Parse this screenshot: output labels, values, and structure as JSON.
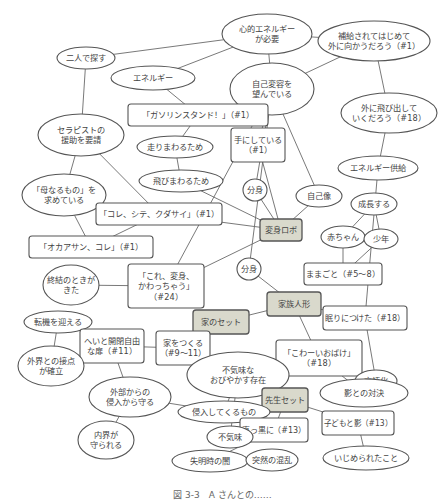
{
  "diagram": {
    "nodes": [
      {
        "id": "kokoro_energy",
        "shape": "ellipse",
        "label": [
          "心的エネルギー",
          "が必要"
        ]
      },
      {
        "id": "hokyu",
        "shape": "ellipse",
        "label": [
          "補給されてはじめて",
          "外に向かうだろう（#1）"
        ]
      },
      {
        "id": "futari",
        "shape": "ellipse",
        "label": [
          "二人で探す"
        ]
      },
      {
        "id": "energy",
        "shape": "ellipse",
        "label": [
          "エネルギー"
        ]
      },
      {
        "id": "jiko_henyo",
        "shape": "ellipse",
        "label": [
          "自己変容を",
          "望んでいる"
        ]
      },
      {
        "id": "gasoline",
        "shape": "box",
        "label": [
          "「ガソリンスタンド！」（#1）"
        ]
      },
      {
        "id": "soto_tobidashi",
        "shape": "ellipse",
        "label": [
          "外に飛び出して",
          "いくだろう（#18）"
        ]
      },
      {
        "id": "therapist",
        "shape": "ellipse",
        "label": [
          "セラピストの",
          "援助を要請"
        ]
      },
      {
        "id": "hashiri",
        "shape": "ellipse",
        "label": [
          "走りまわるため"
        ]
      },
      {
        "id": "te_ni",
        "shape": "box",
        "label": [
          "手にしている",
          "（#1）"
        ]
      },
      {
        "id": "energy_kyokyu",
        "shape": "ellipse",
        "label": [
          "エネルギー供給"
        ]
      },
      {
        "id": "tobi",
        "shape": "ellipse",
        "label": [
          "飛びまわるため"
        ]
      },
      {
        "id": "bunshin1",
        "shape": "ellipse",
        "label": [
          "分身"
        ]
      },
      {
        "id": "jikozo",
        "shape": "ellipse",
        "label": [
          "自己像"
        ]
      },
      {
        "id": "haha",
        "shape": "ellipse",
        "label": [
          "「母なるもの」を",
          "求めている"
        ]
      },
      {
        "id": "seicho",
        "shape": "ellipse",
        "label": [
          "成長する"
        ]
      },
      {
        "id": "kore_shite",
        "shape": "box",
        "label": [
          "「コレ、シテ、クダサイ」（#1）"
        ]
      },
      {
        "id": "henshin_robo",
        "shape": "box",
        "key": true,
        "label": [
          "変身ロボ"
        ]
      },
      {
        "id": "akachan",
        "shape": "ellipse",
        "label": [
          "赤ちゃん"
        ]
      },
      {
        "id": "shonen",
        "shape": "ellipse",
        "label": [
          "少年"
        ]
      },
      {
        "id": "okaasan",
        "shape": "box",
        "label": [
          "「オカアサン、コレ」（#1）"
        ]
      },
      {
        "id": "bunshin2",
        "shape": "ellipse",
        "label": [
          "分身"
        ]
      },
      {
        "id": "mamagoto",
        "shape": "box",
        "label": [
          "ままごと（#5～8）"
        ]
      },
      {
        "id": "shuketsu",
        "shape": "ellipse",
        "label": [
          "終結のときが",
          "きた"
        ]
      },
      {
        "id": "kore_henshin",
        "shape": "box",
        "label": [
          "「これ、変身、",
          "かわっちゃう」",
          "（#24）"
        ]
      },
      {
        "id": "kazoku",
        "shape": "box",
        "key": true,
        "label": [
          "家族人形"
        ]
      },
      {
        "id": "tenki",
        "shape": "ellipse",
        "label": [
          "転機を迎える"
        ]
      },
      {
        "id": "ie_set",
        "shape": "box",
        "key": true,
        "label": [
          "家のセット"
        ]
      },
      {
        "id": "nemuri",
        "shape": "box",
        "label": [
          "眠りにつけた（#18）"
        ]
      },
      {
        "id": "hei",
        "shape": "box",
        "label": [
          "へいと開閉自由",
          "な扉（#11）"
        ]
      },
      {
        "id": "ie_tsukuru",
        "shape": "box",
        "label": [
          "家をつくる",
          "（#9～11）"
        ]
      },
      {
        "id": "kowai",
        "shape": "box",
        "label": [
          "「こわーいおばけ」",
          "（#18）"
        ]
      },
      {
        "id": "gengo",
        "shape": "ellipse",
        "label": [
          "言語化"
        ]
      },
      {
        "id": "gaikai",
        "shape": "ellipse",
        "label": [
          "外界との接点",
          "が確立"
        ]
      },
      {
        "id": "bukimi_sonzai",
        "shape": "ellipse",
        "label": [
          "不気味な",
          "おびやかす存在"
        ]
      },
      {
        "id": "kage_taiketsu",
        "shape": "ellipse",
        "label": [
          "影との対決"
        ]
      },
      {
        "id": "gaibu",
        "shape": "ellipse",
        "label": [
          "外部からの",
          "侵入から守る"
        ]
      },
      {
        "id": "sensei",
        "shape": "box",
        "key": true,
        "label": [
          "先生セット"
        ]
      },
      {
        "id": "shinnyu",
        "shape": "ellipse",
        "label": [
          "侵入してくるもの"
        ]
      },
      {
        "id": "kodomo_kage",
        "shape": "box",
        "label": [
          "子どもと影（#13）"
        ]
      },
      {
        "id": "makkuro",
        "shape": "box",
        "label": [
          "真っ黒に（#13）"
        ]
      },
      {
        "id": "bukimi",
        "shape": "ellipse",
        "label": [
          "不気味"
        ]
      },
      {
        "id": "naikai",
        "shape": "ellipse",
        "label": [
          "内界が",
          "守られる"
        ]
      },
      {
        "id": "ijime",
        "shape": "ellipse",
        "label": [
          "いじめられたこと"
        ]
      },
      {
        "id": "shitsumei",
        "shape": "ellipse",
        "label": [
          "失明時の闇"
        ]
      },
      {
        "id": "totsuzen",
        "shape": "ellipse",
        "label": [
          "突然の混乱"
        ]
      }
    ],
    "edges": [
      [
        "futari",
        "kokoro_energy"
      ],
      [
        "kokoro_energy",
        "hokyu"
      ],
      [
        "kokoro_energy",
        "energy"
      ],
      [
        "kokoro_energy",
        "jiko_henyo"
      ],
      [
        "hokyu",
        "jiko_henyo"
      ],
      [
        "hokyu",
        "soto_tobidashi"
      ],
      [
        "soto_tobidashi",
        "energy_kyokyu"
      ],
      [
        "energy_kyokyu",
        "nemuri"
      ],
      [
        "energy",
        "gasoline"
      ],
      [
        "gasoline",
        "hashiri"
      ],
      [
        "hashiri",
        "tobi"
      ],
      [
        "tobi",
        "henshin_robo"
      ],
      [
        "futari",
        "therapist"
      ],
      [
        "therapist",
        "haha"
      ],
      [
        "therapist",
        "kore_shite"
      ],
      [
        "haha",
        "okaasan"
      ],
      [
        "kore_shite",
        "okaasan"
      ],
      [
        "kore_shite",
        "henshin_robo"
      ],
      [
        "jiko_henyo",
        "te_ni"
      ],
      [
        "jiko_henyo",
        "bunshin1"
      ],
      [
        "jiko_henyo",
        "jikozo"
      ],
      [
        "jiko_henyo",
        "kore_henshin"
      ],
      [
        "jiko_henyo",
        "bunshin2"
      ],
      [
        "te_ni",
        "henshin_robo"
      ],
      [
        "bunshin1",
        "henshin_robo"
      ],
      [
        "jikozo",
        "henshin_robo"
      ],
      [
        "henshin_robo",
        "kore_henshin"
      ],
      [
        "seicho",
        "akachan"
      ],
      [
        "seicho",
        "shonen"
      ],
      [
        "akachan",
        "mamagoto"
      ],
      [
        "shonen",
        "mamagoto"
      ],
      [
        "bunshin2",
        "kazoku"
      ],
      [
        "shuketsu",
        "kore_henshin"
      ],
      [
        "kazoku",
        "ie_set"
      ],
      [
        "kazoku",
        "nemuri"
      ],
      [
        "kazoku",
        "kowai"
      ],
      [
        "nemuri",
        "gengo"
      ],
      [
        "ie_set",
        "ie_tsukuru"
      ],
      [
        "tenki",
        "gaikai"
      ],
      [
        "gaikai",
        "hei"
      ],
      [
        "hei",
        "ie_tsukuru"
      ],
      [
        "hei",
        "gaibu"
      ],
      [
        "gaibu",
        "naikai"
      ],
      [
        "gaibu",
        "shinnyu"
      ],
      [
        "kowai",
        "gengo"
      ],
      [
        "kowai",
        "bukimi_sonzai"
      ],
      [
        "kowai",
        "kage_taiketsu"
      ],
      [
        "bukimi_sonzai",
        "shinnyu"
      ],
      [
        "bukimi_sonzai",
        "bukimi"
      ],
      [
        "sensei",
        "makkuro"
      ],
      [
        "sensei",
        "kodomo_kage"
      ],
      [
        "makkuro",
        "bukimi"
      ],
      [
        "makkuro",
        "shitsumei"
      ],
      [
        "shitsumei",
        "totsuzen"
      ],
      [
        "kodomo_kage",
        "ijime"
      ]
    ]
  },
  "caption": "図 3-3　A さんとの……"
}
